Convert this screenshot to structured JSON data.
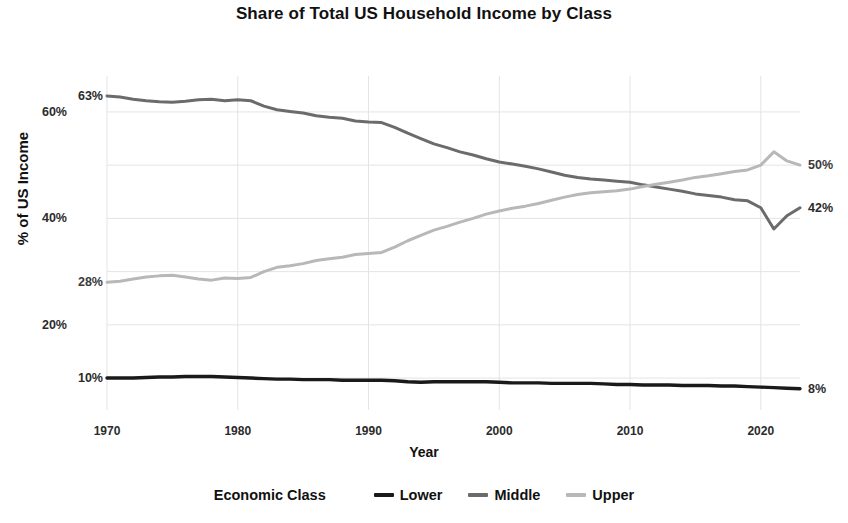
{
  "chart_data": {
    "type": "line",
    "title": "Share of Total US Household Income by Class",
    "xlabel": "Year",
    "ylabel": "% of US Income",
    "xlim": [
      1970,
      2023
    ],
    "ylim": [
      4,
      66
    ],
    "grid": true,
    "y_ticks": [
      "20%",
      "40%",
      "60%"
    ],
    "y_tick_values": [
      20,
      40,
      60
    ],
    "x_ticks": [
      "1970",
      "1980",
      "1990",
      "2000",
      "2010",
      "2020"
    ],
    "x_tick_values": [
      1970,
      1980,
      1990,
      2000,
      2010,
      2020
    ],
    "legend_title": "Economic Class",
    "legend_position": "bottom",
    "start_labels": [
      {
        "series": "Middle",
        "text": "63%",
        "year": 1970,
        "value": 63
      },
      {
        "series": "Upper",
        "text": "28%",
        "year": 1970,
        "value": 28
      },
      {
        "series": "Lower",
        "text": "10%",
        "year": 1970,
        "value": 10
      }
    ],
    "end_labels": [
      {
        "series": "Upper",
        "text": "50%",
        "year": 2023,
        "value": 50
      },
      {
        "series": "Middle",
        "text": "42%",
        "year": 2023,
        "value": 42
      },
      {
        "series": "Lower",
        "text": "8%",
        "year": 2023,
        "value": 8
      }
    ],
    "x": [
      1970,
      1971,
      1972,
      1973,
      1974,
      1975,
      1976,
      1977,
      1978,
      1979,
      1980,
      1981,
      1982,
      1983,
      1984,
      1985,
      1986,
      1987,
      1988,
      1989,
      1990,
      1991,
      1992,
      1993,
      1994,
      1995,
      1996,
      1997,
      1998,
      1999,
      2000,
      2001,
      2002,
      2003,
      2004,
      2005,
      2006,
      2007,
      2008,
      2009,
      2010,
      2011,
      2012,
      2013,
      2014,
      2015,
      2016,
      2017,
      2018,
      2019,
      2020,
      2021,
      2022,
      2023
    ],
    "series": [
      {
        "name": "Lower",
        "color": "#1a1a1a",
        "values": [
          10.0,
          10.0,
          10.0,
          10.1,
          10.2,
          10.2,
          10.3,
          10.3,
          10.3,
          10.2,
          10.1,
          10.0,
          9.9,
          9.8,
          9.8,
          9.7,
          9.7,
          9.7,
          9.6,
          9.6,
          9.6,
          9.6,
          9.5,
          9.3,
          9.2,
          9.3,
          9.3,
          9.3,
          9.3,
          9.3,
          9.2,
          9.1,
          9.1,
          9.1,
          9.0,
          9.0,
          9.0,
          9.0,
          8.9,
          8.8,
          8.8,
          8.7,
          8.7,
          8.7,
          8.6,
          8.6,
          8.6,
          8.5,
          8.5,
          8.4,
          8.3,
          8.2,
          8.1,
          8.0
        ]
      },
      {
        "name": "Middle",
        "color": "#6b6b6b",
        "values": [
          63.0,
          62.8,
          62.4,
          62.1,
          61.9,
          61.8,
          62.0,
          62.3,
          62.4,
          62.1,
          62.3,
          62.1,
          61.1,
          60.4,
          60.1,
          59.8,
          59.3,
          59.0,
          58.8,
          58.3,
          58.1,
          58.0,
          57.1,
          56.0,
          55.0,
          54.0,
          53.3,
          52.5,
          51.9,
          51.2,
          50.6,
          50.2,
          49.8,
          49.3,
          48.7,
          48.1,
          47.7,
          47.4,
          47.2,
          47.0,
          46.8,
          46.3,
          45.9,
          45.5,
          45.1,
          44.6,
          44.3,
          44.0,
          43.5,
          43.3,
          42.0,
          38.0,
          40.5,
          42.0
        ]
      },
      {
        "name": "Upper",
        "color": "#b8b8b8",
        "values": [
          28.0,
          28.2,
          28.6,
          29.0,
          29.2,
          29.3,
          29.0,
          28.6,
          28.4,
          28.8,
          28.7,
          28.9,
          30.0,
          30.8,
          31.1,
          31.5,
          32.1,
          32.4,
          32.7,
          33.2,
          33.4,
          33.6,
          34.6,
          35.8,
          36.8,
          37.8,
          38.5,
          39.3,
          40.0,
          40.8,
          41.4,
          41.9,
          42.3,
          42.8,
          43.4,
          44.0,
          44.5,
          44.8,
          45.0,
          45.2,
          45.5,
          46.0,
          46.4,
          46.8,
          47.2,
          47.7,
          48.0,
          48.4,
          48.8,
          49.1,
          50.0,
          52.5,
          50.8,
          50.0
        ]
      }
    ]
  },
  "colors": {
    "grid": "#e4e4e4",
    "lower": "#1a1a1a",
    "middle": "#6b6b6b",
    "upper": "#b8b8b8",
    "text": "#111111"
  }
}
